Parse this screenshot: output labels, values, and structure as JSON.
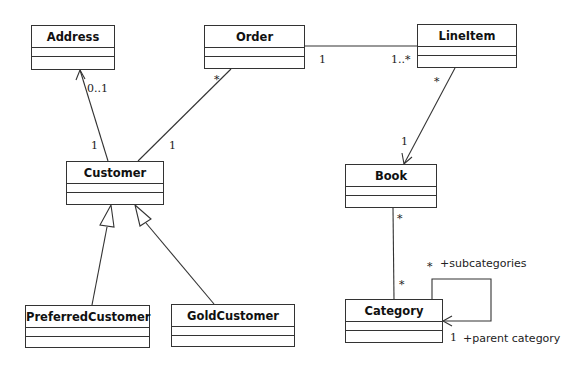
{
  "diagram": {
    "type": "UML class diagram",
    "classes": [
      {
        "id": "address",
        "name": "Address"
      },
      {
        "id": "order",
        "name": "Order"
      },
      {
        "id": "lineitem",
        "name": "LineItem"
      },
      {
        "id": "customer",
        "name": "Customer"
      },
      {
        "id": "book",
        "name": "Book"
      },
      {
        "id": "preferredcustomer",
        "name": "PreferredCustomer"
      },
      {
        "id": "goldcustomer",
        "name": "GoldCustomer"
      },
      {
        "id": "category",
        "name": "Category"
      }
    ],
    "associations": [
      {
        "from": "Customer",
        "to": "Address",
        "kind": "directed association",
        "from_mult": "1",
        "to_mult": "0..1"
      },
      {
        "from": "Customer",
        "to": "Order",
        "kind": "association",
        "from_mult": "1",
        "to_mult": "*"
      },
      {
        "from": "Order",
        "to": "LineItem",
        "kind": "association",
        "from_mult": "1",
        "to_mult": "1..*"
      },
      {
        "from": "LineItem",
        "to": "Book",
        "kind": "directed association",
        "from_mult": "*",
        "to_mult": "1"
      },
      {
        "from": "Book",
        "to": "Category",
        "kind": "association",
        "from_mult": "*",
        "to_mult": "*"
      },
      {
        "from": "Category",
        "to": "Category",
        "kind": "directed self association",
        "from_mult": "*",
        "from_role": "+subcategories",
        "to_mult": "1",
        "to_role": "+parent category"
      }
    ],
    "generalizations": [
      {
        "child": "PreferredCustomer",
        "parent": "Customer"
      },
      {
        "child": "GoldCustomer",
        "parent": "Customer"
      }
    ],
    "labels": {
      "address_mult": "0..1",
      "customer_address_mult": "1",
      "order_customer_mult": "*",
      "customer_order_mult": "1",
      "order_lineitem_mult": "1",
      "lineitem_order_mult": "1..*",
      "lineitem_book_mult": "*",
      "book_lineitem_mult": "1",
      "book_category_mult": "*",
      "category_book_mult": "*",
      "subcategories_mult": "*",
      "subcategories_role": "+subcategories",
      "parent_mult": "1",
      "parent_role": "+parent category"
    }
  }
}
